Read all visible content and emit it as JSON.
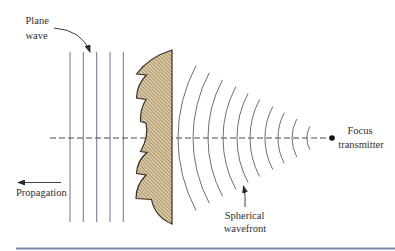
{
  "figure": {
    "labels": {
      "plane_wave": [
        "Plane",
        "wave"
      ],
      "propagation": "Propagation",
      "focus_transmitter": [
        "Focus",
        "transmitter"
      ],
      "spherical_wavefront": [
        "Spherical",
        "wavefront"
      ]
    },
    "elements": {
      "plane_wave_lines": 5,
      "spherical_wavefront_arcs": 10,
      "lens": "zoned (Fresnel-type) lens, hatched cross-section",
      "axis": "dashed optical axis ending at focus point"
    }
  },
  "colors": {
    "lens_fill": "#dccaa2",
    "lens_hatch": "#7a6445",
    "lens_outline": "#3a2e22",
    "wave_lines": "#6c7290",
    "axis": "#4a4a4a",
    "bottom_rule": "#7c87ad"
  }
}
